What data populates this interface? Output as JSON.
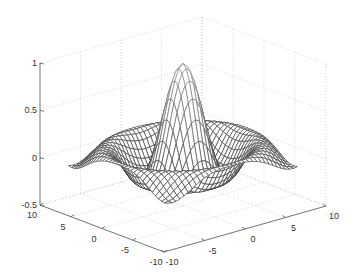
{
  "chart_data": {
    "type": "surface-mesh",
    "title": "",
    "function": "z = sin(R)/R, R = sqrt(x^2 + y^2)",
    "xlabel": "",
    "ylabel": "",
    "zlabel": "",
    "x_range": [
      -8,
      8
    ],
    "y_range": [
      -8,
      8
    ],
    "xlim": [
      -10,
      10
    ],
    "ylim": [
      -10,
      10
    ],
    "zlim": [
      -0.5,
      1
    ],
    "grid": true,
    "x_ticks": [
      "-10",
      "-5",
      "0",
      "5",
      "10"
    ],
    "y_ticks": [
      "10",
      "5",
      "0",
      "-5",
      "-10"
    ],
    "z_ticks": [
      "-0.5",
      "0",
      "0.5",
      "1"
    ],
    "peak": {
      "x": 0,
      "y": 0,
      "z": 1
    },
    "colors": {
      "mesh": "#2a2a2a",
      "axis": "#555555",
      "grid": "#bbbbbb"
    }
  }
}
